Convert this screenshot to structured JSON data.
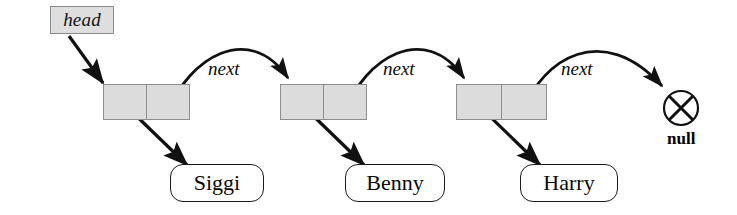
{
  "diagram": {
    "head_pointer": {
      "label": "head",
      "x": 50,
      "y": 6,
      "w": 64,
      "h": 28
    },
    "null_terminator": {
      "label": "null",
      "symbol": "circle-x",
      "cx": 681,
      "cy": 108,
      "r": 17,
      "label_x": 667,
      "label_y": 129
    },
    "edge_labels": [
      {
        "text": "next",
        "x": 208,
        "y": 58
      },
      {
        "text": "next",
        "x": 383,
        "y": 58
      },
      {
        "text": "next",
        "x": 561,
        "y": 58
      }
    ],
    "nodes": [
      {
        "id": "node-1",
        "value_label": "Siggi",
        "box": {
          "x": 103,
          "y": 84,
          "w": 88,
          "h": 36
        },
        "name_box": {
          "x": 170,
          "y": 164,
          "w": 94,
          "h": 38
        }
      },
      {
        "id": "node-2",
        "value_label": "Benny",
        "box": {
          "x": 280,
          "y": 84,
          "w": 88,
          "h": 36
        },
        "name_box": {
          "x": 345,
          "y": 164,
          "w": 100,
          "h": 38
        }
      },
      {
        "id": "node-3",
        "value_label": "Harry",
        "box": {
          "x": 456,
          "y": 84,
          "w": 92,
          "h": 36
        },
        "name_box": {
          "x": 520,
          "y": 164,
          "w": 98,
          "h": 38
        }
      }
    ],
    "colors": {
      "node_fill": "#dcdcdc",
      "head_fill": "#dedede",
      "stroke": "#111111",
      "node_border": "#8d8d8d",
      "background": "#ffffff"
    }
  }
}
